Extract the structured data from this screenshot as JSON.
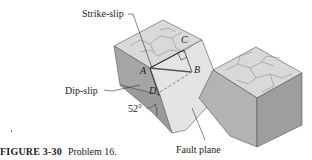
{
  "figure": {
    "labels": {
      "strike_slip": "Strike-slip",
      "dip_slip": "Dip-slip",
      "fault_plane": "Fault plane",
      "angle": "52°"
    },
    "points": {
      "a": "A",
      "b": "B",
      "c": "C",
      "d": "D"
    },
    "colors": {
      "block_top": "#d9d9d9",
      "block_side_dark": "#9a9a9a",
      "block_side_mid": "#b3b3b3",
      "fault_face": "#e4e4e4",
      "crack": "#8f8f8f",
      "line": "#333333"
    }
  },
  "caption": {
    "figure_number": "FIGURE 3-30",
    "text": "Problem 16."
  }
}
